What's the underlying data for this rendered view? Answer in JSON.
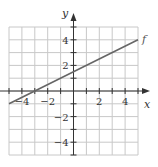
{
  "chart_data": {
    "type": "line",
    "title": "",
    "xlabel": "x",
    "ylabel": "y",
    "xlim": [
      -5,
      5
    ],
    "ylim": [
      -5,
      5
    ],
    "grid": true,
    "x_ticks": [
      -4,
      -2,
      2,
      4
    ],
    "y_ticks": [
      -4,
      -2,
      2,
      4
    ],
    "x_tick_labels": [
      "−4",
      "−2",
      "2",
      "4"
    ],
    "y_tick_labels": [
      "−4",
      "−2",
      "2",
      "4"
    ],
    "series": [
      {
        "name": "f",
        "x": [
          -5,
          -3,
          0,
          5
        ],
        "y": [
          -1,
          0,
          1.5,
          4
        ],
        "slope": 0.5,
        "intercept": 1.5
      }
    ],
    "annotations": [
      {
        "text": "f",
        "x": 5,
        "y": 4
      }
    ]
  },
  "colors": {
    "grid": "#c8c8c8",
    "axis": "#333333",
    "line": "#666666"
  }
}
